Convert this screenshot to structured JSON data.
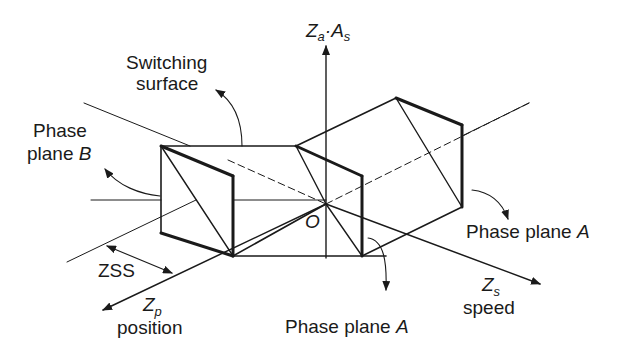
{
  "diagram": {
    "type": "3d-phase-space",
    "axes": {
      "vertical": {
        "label": "Z",
        "sub": "a",
        "dot": "·",
        "label2": "A",
        "sub2": "s"
      },
      "position": {
        "label": "Z",
        "sub": "p",
        "caption": "position"
      },
      "speed": {
        "label": "Z",
        "sub": "s",
        "caption": "speed"
      }
    },
    "origin_label": "O",
    "labels": {
      "switching_surface_line1": "Switching",
      "switching_surface_line2": "surface",
      "phase_plane_b_line1": "Phase",
      "phase_plane_b_line2": "plane ",
      "phase_plane_b_letter": "B",
      "phase_plane_a_right": "Phase plane ",
      "phase_plane_a_right_letter": "A",
      "phase_plane_a_bottom": "Phase plane ",
      "phase_plane_a_bottom_letter": "A",
      "zss": "ZSS"
    },
    "colors": {
      "stroke": "#1a1a1a",
      "background": "#ffffff"
    }
  }
}
